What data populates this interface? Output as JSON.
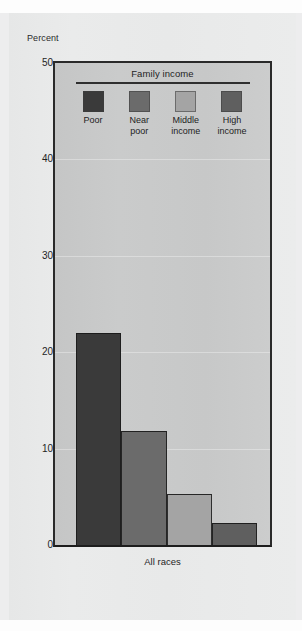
{
  "chart_data": {
    "type": "bar",
    "title": "",
    "subtitle": "",
    "xlabel": "",
    "ylabel": "Percent",
    "categories": [
      "All races"
    ],
    "legend_title": "Family income",
    "legend_position": "inside-top-center",
    "grid": true,
    "ylim": [
      0,
      50
    ],
    "yticks": [
      0,
      10,
      20,
      30,
      40,
      50
    ],
    "ytick_labels": [
      "0",
      "10",
      "20",
      "30",
      "40",
      "50"
    ],
    "series": [
      {
        "name": "Poor",
        "label": "Poor",
        "values": [
          22.0
        ],
        "color": "#3a3a3a"
      },
      {
        "name": "Near poor",
        "label": "Near\npoor",
        "values": [
          11.8
        ],
        "color": "#6b6b6b"
      },
      {
        "name": "Middle income",
        "label": "Middle\nincome",
        "values": [
          5.3
        ],
        "color": "#a4a4a4"
      },
      {
        "name": "High income",
        "label": "High\nincome",
        "values": [
          2.3
        ],
        "color": "#5f5f5f"
      }
    ],
    "annotations": []
  },
  "axes": {
    "y_title": "Percent",
    "ticks": [
      {
        "label": "50",
        "value": 50
      },
      {
        "label": "40",
        "value": 40
      },
      {
        "label": "30",
        "value": 30
      },
      {
        "label": "20",
        "value": 20
      },
      {
        "label": "10",
        "value": 10
      },
      {
        "label": "0",
        "value": 0
      }
    ],
    "x_category_label": "All races"
  },
  "legend": {
    "title": "Family income",
    "items": [
      {
        "label": "Poor",
        "color": "#3a3a3a"
      },
      {
        "label": "Near\npoor",
        "color": "#6b6b6b"
      },
      {
        "label": "Middle\nincome",
        "color": "#a4a4a4"
      },
      {
        "label": "High\nincome",
        "color": "#5f5f5f"
      }
    ]
  },
  "colors": {
    "page_background": "#ededee",
    "card_background": "#e9eaea",
    "plot_background": "#c9caca",
    "axis_line": "#1d1d1d",
    "text": "#1f1f1f"
  }
}
